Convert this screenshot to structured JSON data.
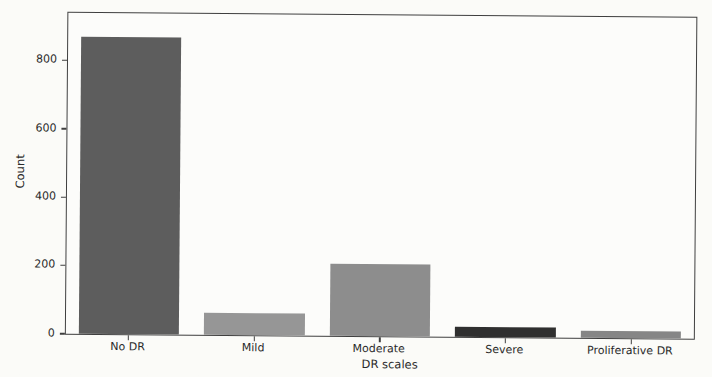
{
  "figure": {
    "background_color": "#fbfbf8",
    "axis_color": "#3f3f3f",
    "text_color": "#2a2a2a"
  },
  "chart_data": {
    "type": "bar",
    "title": "",
    "xlabel": "DR scales",
    "ylabel": "Count",
    "categories": [
      "No DR",
      "Mild",
      "Moderate",
      "Severe",
      "Proliferative DR"
    ],
    "values": [
      870,
      65,
      210,
      30,
      20
    ],
    "bar_colors": [
      "#5d5d5d",
      "#969696",
      "#8d8d8d",
      "#2f2f2f",
      "#868686"
    ],
    "y_ticks": [
      0,
      200,
      400,
      600,
      800
    ],
    "ylim": [
      0,
      940
    ],
    "grid": false,
    "legend": "none",
    "frame": "full-box",
    "bar_width_fraction": 0.8
  }
}
